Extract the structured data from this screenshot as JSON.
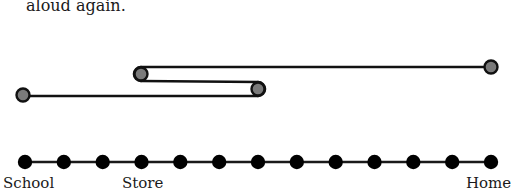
{
  "caption": {
    "text": "aloud again."
  },
  "number_line": {
    "dot_count": 13,
    "start_x": 25,
    "spacing": 38.8,
    "y": 162,
    "dot_radius": 7,
    "dot_color": "#000000",
    "line_color": "#1a1a1a"
  },
  "labels": {
    "school": "School",
    "store": "Store",
    "home": "Home"
  },
  "path": {
    "description": "Walk path: School -> past Store -> back toward Store -> Home",
    "stroke_color": "#111111",
    "marker_fill": "#7a7a7a",
    "markers": [
      {
        "name": "start",
        "x": 23,
        "y": 95
      },
      {
        "name": "turn-1",
        "x": 258,
        "y": 89
      },
      {
        "name": "turn-2",
        "x": 141,
        "y": 74
      },
      {
        "name": "end",
        "x": 491,
        "y": 67
      }
    ]
  }
}
